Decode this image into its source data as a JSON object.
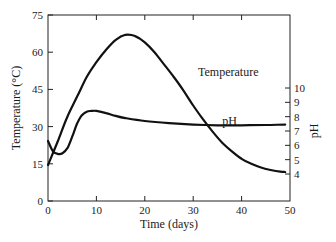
{
  "chart_data": {
    "type": "line",
    "title": "",
    "xlabel": "Time (days)",
    "ylabel": "Temperature (°C)",
    "y2label": "pH",
    "xlim": [
      0,
      50
    ],
    "ylim": [
      0,
      75
    ],
    "y2lim": [
      4,
      10
    ],
    "x_ticks": [
      0,
      10,
      20,
      30,
      40,
      50
    ],
    "y_ticks": [
      0,
      15,
      30,
      45,
      60,
      75
    ],
    "y2_ticks": [
      4,
      5,
      6,
      7,
      8,
      9,
      10
    ],
    "grid": false,
    "legend": "inline labels",
    "series": [
      {
        "name": "Temperature",
        "axis": "left",
        "label_position": {
          "x": 31,
          "y": 52
        },
        "x": [
          0,
          2,
          4,
          6,
          8,
          10,
          12,
          14,
          16,
          18,
          20,
          22,
          24,
          26,
          28,
          30,
          32,
          34,
          36,
          38,
          40,
          42,
          44,
          46,
          48,
          49
        ],
        "values": [
          14.5,
          24,
          34,
          42,
          50,
          56,
          61,
          65,
          67,
          66.5,
          64,
          60,
          55,
          50,
          44.5,
          38.5,
          33,
          28,
          23.5,
          20,
          17,
          15,
          13.5,
          12.5,
          11.8,
          11.7
        ]
      },
      {
        "name": "pH",
        "axis": "right",
        "label_position": {
          "x": 36,
          "y": 7.7
        },
        "x": [
          0,
          1,
          2,
          3,
          4,
          5,
          6,
          7,
          8,
          9,
          10,
          12,
          14,
          16,
          20,
          25,
          30,
          35,
          40,
          45,
          49
        ],
        "values": [
          6.3,
          5.6,
          5.4,
          5.45,
          5.8,
          6.6,
          7.5,
          8.1,
          8.35,
          8.4,
          8.4,
          8.25,
          8.05,
          7.9,
          7.7,
          7.55,
          7.45,
          7.4,
          7.4,
          7.42,
          7.45
        ]
      }
    ]
  },
  "labels": {
    "temperature_series": "Temperature",
    "ph_series": "pH",
    "x_axis": "Time (days)",
    "y_axis_left": "Temperature (°C)",
    "y_axis_right": "pH"
  }
}
